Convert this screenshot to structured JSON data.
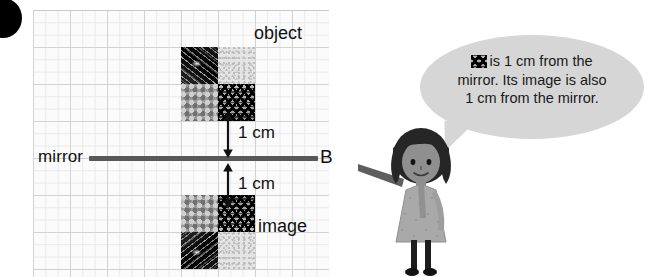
{
  "diagram": {
    "labels": {
      "object": "object",
      "image": "image",
      "mirror": "mirror",
      "point_b": "B",
      "distance_above": "1 cm",
      "distance_below": "1 cm"
    },
    "grid": {
      "minor_cell_px": 12.33,
      "major_cell_px": 37,
      "minor_line_color": "#e9e9e9",
      "major_line_color": "#d2d2d2",
      "background_color": "#fbfbfb"
    },
    "mirror_line": {
      "color": "#585858",
      "thickness_px": 5,
      "endpoint_label": "B"
    },
    "object_shape": {
      "description": "2 by 2 block of patterned squares above the mirror line",
      "cells": [
        {
          "row": 0,
          "col": 0,
          "texture": "dark-diagonal-streaks"
        },
        {
          "row": 0,
          "col": 1,
          "texture": "light-fine-speckle"
        },
        {
          "row": 1,
          "col": 0,
          "texture": "grey-pebble"
        },
        {
          "row": 1,
          "col": 1,
          "texture": "black-zigzag-waves"
        }
      ]
    },
    "image_shape": {
      "description": "Mirror image of the object, reflected below the mirror line",
      "cells": [
        {
          "row": 0,
          "col": 0,
          "texture": "grey-pebble"
        },
        {
          "row": 0,
          "col": 1,
          "texture": "black-zigzag-waves"
        },
        {
          "row": 1,
          "col": 0,
          "texture": "dark-diagonal-streaks"
        },
        {
          "row": 1,
          "col": 1,
          "texture": "light-fine-speckle"
        }
      ]
    },
    "measurements": [
      {
        "label": "1 cm",
        "position": "above-mirror",
        "arrow": "double-headed-vertical"
      },
      {
        "label": "1 cm",
        "position": "below-mirror",
        "arrow": "double-headed-vertical"
      }
    ]
  },
  "speech_bubble": {
    "line1_prefix": "is 1 cm from the",
    "line2": "mirror. Its image is also",
    "line3": "1 cm from the mirror.",
    "full_text": "▒ is 1 cm from the mirror. Its image is also 1 cm from the mirror.",
    "background_color": "#d6d6d6",
    "text_color": "#1a1a1a"
  },
  "character": {
    "name": "girl-pointing",
    "description": "Cartoon girl with dark bob hair, patterned grey dress, pointing left toward the diagram",
    "colors": {
      "hair": "#262626",
      "skin": "#8a8a8a",
      "dress": "#a8a8a8",
      "legs": "#1d1d1d"
    }
  },
  "decorations": {
    "corner_dot": {
      "name": "page-corner-dot",
      "color": "#000000"
    }
  }
}
